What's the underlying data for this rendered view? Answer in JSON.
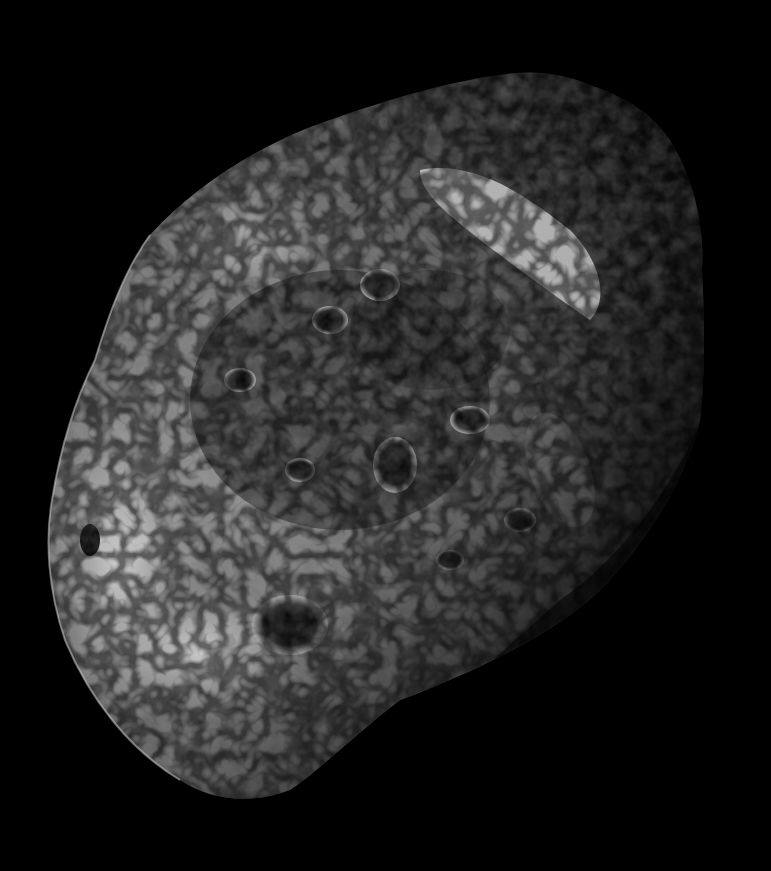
{
  "image": {
    "subject": "Cratered, sponge-like irregular moon (Hyperion) photographed in grayscale against black space",
    "background_color": "#000000",
    "palette": {
      "highlight": "#e6e6e6",
      "midtone": "#8a8a8a",
      "shadow": "#2a2a2a",
      "space": "#000000"
    },
    "lighting": "Sunlit from the left; right/lower-right limb falls into deep shadow",
    "features": [
      "bright ray streak across upper-center surface",
      "densely pitted dark crater field in center",
      "bright smooth slopes on lower-left limb",
      "large dark crater on lower-center",
      "terminator shadow along right side"
    ]
  }
}
